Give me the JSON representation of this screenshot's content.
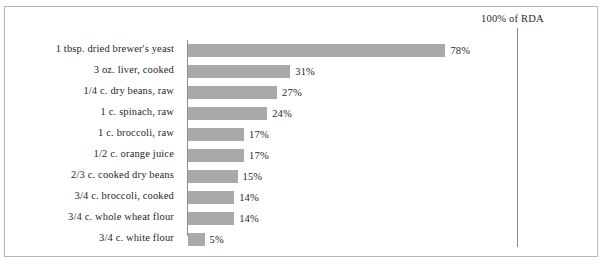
{
  "chart_data": {
    "type": "bar",
    "orientation": "horizontal",
    "title": "",
    "xlabel": "",
    "ylabel": "",
    "xlim": [
      0,
      100
    ],
    "grid": false,
    "legend": null,
    "reference_line": {
      "label": "100% of RDA",
      "value": 100
    },
    "value_suffix": "%",
    "categories": [
      "1 tbsp. dried brewer's yeast",
      "3 oz. liver, cooked",
      "1/4 c. dry beans, raw",
      "1 c. spinach, raw",
      "1 c. broccoli, raw",
      "1/2 c. orange juice",
      "2/3 c. cooked dry beans",
      "3/4 c. broccoli, cooked",
      "3/4 c. whole wheat flour",
      "3/4 c. white flour"
    ],
    "values": [
      78,
      31,
      27,
      24,
      17,
      17,
      15,
      14,
      14,
      5
    ],
    "value_labels": [
      "78%",
      "31%",
      "27%",
      "24%",
      "17%",
      "17%",
      "15%",
      "14%",
      "14%",
      "5%"
    ],
    "colors": {
      "bar": "#a9a9a9",
      "axis": "#8d8d8d",
      "border": "#b9b9b9",
      "text": "#1f1f1f",
      "background": "#ffffff"
    }
  }
}
